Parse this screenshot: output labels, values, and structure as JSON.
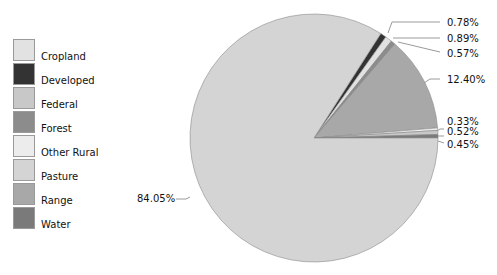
{
  "chart_data": {
    "type": "pie",
    "title": "",
    "legend_position": "left",
    "categories": [
      "Cropland",
      "Developed",
      "Federal",
      "Forest",
      "Other Rural",
      "Pasture",
      "Range",
      "Water"
    ],
    "colors": [
      "#e2e2e2",
      "#333333",
      "#c8c8c8",
      "#8c8c8c",
      "#ececec",
      "#d4d4d4",
      "#a8a8a8",
      "#7a7a7a"
    ],
    "slices": [
      {
        "category": "Developed",
        "value": 0.78,
        "label": "0.78%"
      },
      {
        "category": "Cropland",
        "value": 0.89,
        "label": "0.89%"
      },
      {
        "category": "Forest",
        "value": 0.57,
        "label": "0.57%"
      },
      {
        "category": "Range",
        "value": 12.4,
        "label": "12.40%"
      },
      {
        "category": "Other Rural",
        "value": 0.33,
        "label": "0.33%"
      },
      {
        "category": "Federal",
        "value": 0.52,
        "label": "0.52%"
      },
      {
        "category": "Water",
        "value": 0.45,
        "label": "0.45%"
      },
      {
        "category": "Pasture",
        "value": 84.05,
        "label": "84.05%"
      }
    ]
  },
  "legend": {
    "items": [
      {
        "label": "Cropland",
        "color": "#e2e2e2"
      },
      {
        "label": "Developed",
        "color": "#333333"
      },
      {
        "label": "Federal",
        "color": "#c8c8c8"
      },
      {
        "label": "Forest",
        "color": "#8c8c8c"
      },
      {
        "label": "Other Rural",
        "color": "#ececec"
      },
      {
        "label": "Pasture",
        "color": "#d4d4d4"
      },
      {
        "label": "Range",
        "color": "#a8a8a8"
      },
      {
        "label": "Water",
        "color": "#7a7a7a"
      }
    ]
  },
  "labels": {
    "l0": "0.78%",
    "l1": "0.89%",
    "l2": "0.57%",
    "l3": "12.40%",
    "l4": "0.33%",
    "l5": "0.52%",
    "l6": "0.45%",
    "l7": "84.05%"
  }
}
